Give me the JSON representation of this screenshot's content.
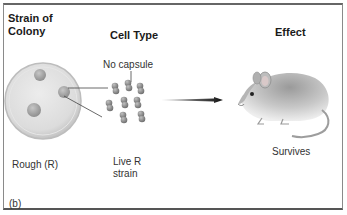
{
  "figure": {
    "panel_label": "(b)",
    "columns": {
      "strain": "Strain of\nColony",
      "strain_line1": "Strain of",
      "strain_line2": "Colony",
      "cell_type": "Cell Type",
      "effect": "Effect"
    },
    "row": {
      "strain_value": "Rough (R)",
      "cell_annotation": "No capsule",
      "cell_value_line1": "Live R",
      "cell_value_line2": "strain",
      "effect_value": "Survives"
    },
    "icons": {
      "petri_dish": "petri-dish-with-colonies",
      "bacteria": "diplococci-cluster",
      "arrow": "right-arrow",
      "mouse": "mouse"
    },
    "colors": {
      "border": "#8a8a8a",
      "dish": "#d6d6d6",
      "colony": "#a9a9a9",
      "bacteria": "#8e8e8e",
      "arrow": "#111111"
    }
  }
}
